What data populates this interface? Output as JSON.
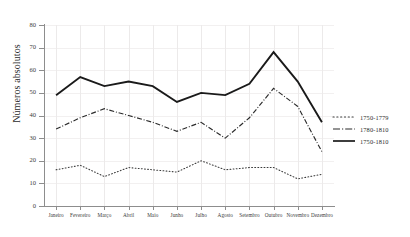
{
  "chart_data": {
    "type": "line",
    "title": "",
    "xlabel": "",
    "ylabel": "Números absolutos",
    "ylim": [
      0,
      80
    ],
    "yticks": [
      0,
      10,
      20,
      30,
      40,
      50,
      60,
      70,
      80
    ],
    "grid": true,
    "legend_position": "right",
    "categories": [
      "Janeiro",
      "Fevereiro",
      "Março",
      "Abril",
      "Maio",
      "Junho",
      "Julho",
      "Agosto",
      "Setembro",
      "Outubro",
      "Novembro",
      "Dezembro"
    ],
    "series": [
      {
        "name": "1750-1779",
        "style": "dotted",
        "color": "#3a3a3a",
        "values": [
          16,
          18,
          13,
          17,
          16,
          15,
          20,
          16,
          17,
          17,
          12,
          14
        ]
      },
      {
        "name": "1780-1810",
        "style": "dash-dot",
        "color": "#2b2b2b",
        "values": [
          34,
          39,
          43,
          40,
          37,
          33,
          37,
          30,
          39,
          52,
          44,
          24
        ]
      },
      {
        "name": "1750-1810",
        "style": "solid",
        "color": "#1a1a1a",
        "values": [
          49,
          57,
          53,
          55,
          53,
          46,
          50,
          49,
          54,
          68,
          55,
          37
        ]
      }
    ]
  },
  "axis": {
    "y_title": "Números absolutos",
    "y_tick_labels": [
      "0",
      "10",
      "20",
      "30",
      "40",
      "50",
      "60",
      "70",
      "80"
    ],
    "x_tick_labels": [
      "Janeiro",
      "Fevereiro",
      "Março",
      "Abril",
      "Maio",
      "Junho",
      "Julho",
      "Agosto",
      "Setembro",
      "Outubro",
      "Novembro",
      "Dezembro"
    ]
  },
  "legend": {
    "items": [
      {
        "label": "1750-1779"
      },
      {
        "label": "1780-1810"
      },
      {
        "label": "1750-1810"
      }
    ]
  },
  "colors": {
    "axis": "#8d8d8d",
    "grid": "#eceaea",
    "text": "#2b2b2b",
    "line_solid": "#1a1a1a",
    "line_dashdot": "#2b2b2b",
    "line_dotted": "#3a3a3a"
  }
}
